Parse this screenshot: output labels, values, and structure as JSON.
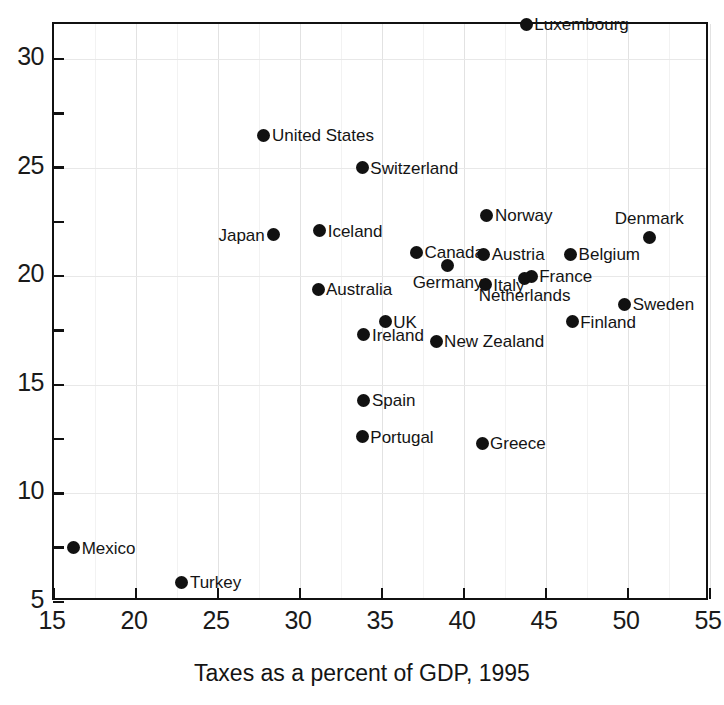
{
  "chart_data": {
    "type": "scatter",
    "title": "",
    "xlabel": "Taxes as a percent of GDP, 1995",
    "ylabel": "",
    "xlim": [
      15,
      55
    ],
    "ylim": [
      5,
      31.6
    ],
    "grid": true,
    "legend": "none",
    "xticks": [
      "15",
      "20",
      "25",
      "30",
      "35",
      "40",
      "45",
      "50",
      "55"
    ],
    "xtick_values": [
      15,
      20,
      25,
      30,
      35,
      40,
      45,
      50,
      55
    ],
    "yticks": [
      "5",
      "10",
      "15",
      "20",
      "25",
      "30"
    ],
    "ytick_values": [
      5,
      10,
      15,
      20,
      25,
      30
    ],
    "yticks_minor": [
      7.5,
      12.5,
      17.5,
      22.5,
      27.5
    ],
    "points": [
      {
        "name": "Luxembourg",
        "x": 43.8,
        "y": 31.6,
        "label_pos": "right"
      },
      {
        "name": "United States",
        "x": 27.8,
        "y": 26.5,
        "label_pos": "right"
      },
      {
        "name": "Switzerland",
        "x": 33.8,
        "y": 25.0,
        "label_pos": "right"
      },
      {
        "name": "Norway",
        "x": 41.4,
        "y": 22.8,
        "label_pos": "right"
      },
      {
        "name": "Denmark",
        "x": 51.3,
        "y": 21.8,
        "label_pos": "above"
      },
      {
        "name": "Iceland",
        "x": 31.2,
        "y": 22.1,
        "label_pos": "right"
      },
      {
        "name": "Japan",
        "x": 28.4,
        "y": 21.9,
        "label_pos": "left"
      },
      {
        "name": "Canada",
        "x": 37.1,
        "y": 21.1,
        "label_pos": "right"
      },
      {
        "name": "Austria",
        "x": 41.2,
        "y": 21.0,
        "label_pos": "right"
      },
      {
        "name": "Belgium",
        "x": 46.5,
        "y": 21.0,
        "label_pos": "right"
      },
      {
        "name": "Germany",
        "x": 39.0,
        "y": 20.5,
        "label_pos": "below"
      },
      {
        "name": "France",
        "x": 44.1,
        "y": 20.0,
        "label_pos": "right"
      },
      {
        "name": "Netherlands",
        "x": 43.7,
        "y": 19.9,
        "label_pos": "below"
      },
      {
        "name": "Australia",
        "x": 31.1,
        "y": 19.4,
        "label_pos": "right"
      },
      {
        "name": "Italy",
        "x": 41.3,
        "y": 19.6,
        "label_pos": "right"
      },
      {
        "name": "Sweden",
        "x": 49.8,
        "y": 18.7,
        "label_pos": "right"
      },
      {
        "name": "UK",
        "x": 35.2,
        "y": 17.9,
        "label_pos": "right"
      },
      {
        "name": "Finland",
        "x": 46.6,
        "y": 17.9,
        "label_pos": "right"
      },
      {
        "name": "Ireland",
        "x": 33.9,
        "y": 17.3,
        "label_pos": "right"
      },
      {
        "name": "New Zealand",
        "x": 38.3,
        "y": 17.0,
        "label_pos": "right"
      },
      {
        "name": "Spain",
        "x": 33.9,
        "y": 14.3,
        "label_pos": "right"
      },
      {
        "name": "Portugal",
        "x": 33.8,
        "y": 12.6,
        "label_pos": "right"
      },
      {
        "name": "Greece",
        "x": 41.1,
        "y": 12.3,
        "label_pos": "right"
      },
      {
        "name": "Mexico",
        "x": 16.2,
        "y": 7.5,
        "label_pos": "right"
      },
      {
        "name": "Turkey",
        "x": 22.8,
        "y": 5.9,
        "label_pos": "right"
      }
    ]
  },
  "colors": {
    "marker": "#111111",
    "axis": "#111111",
    "grid": "#e2e2e2",
    "background": "#ffffff",
    "text": "#141414"
  }
}
